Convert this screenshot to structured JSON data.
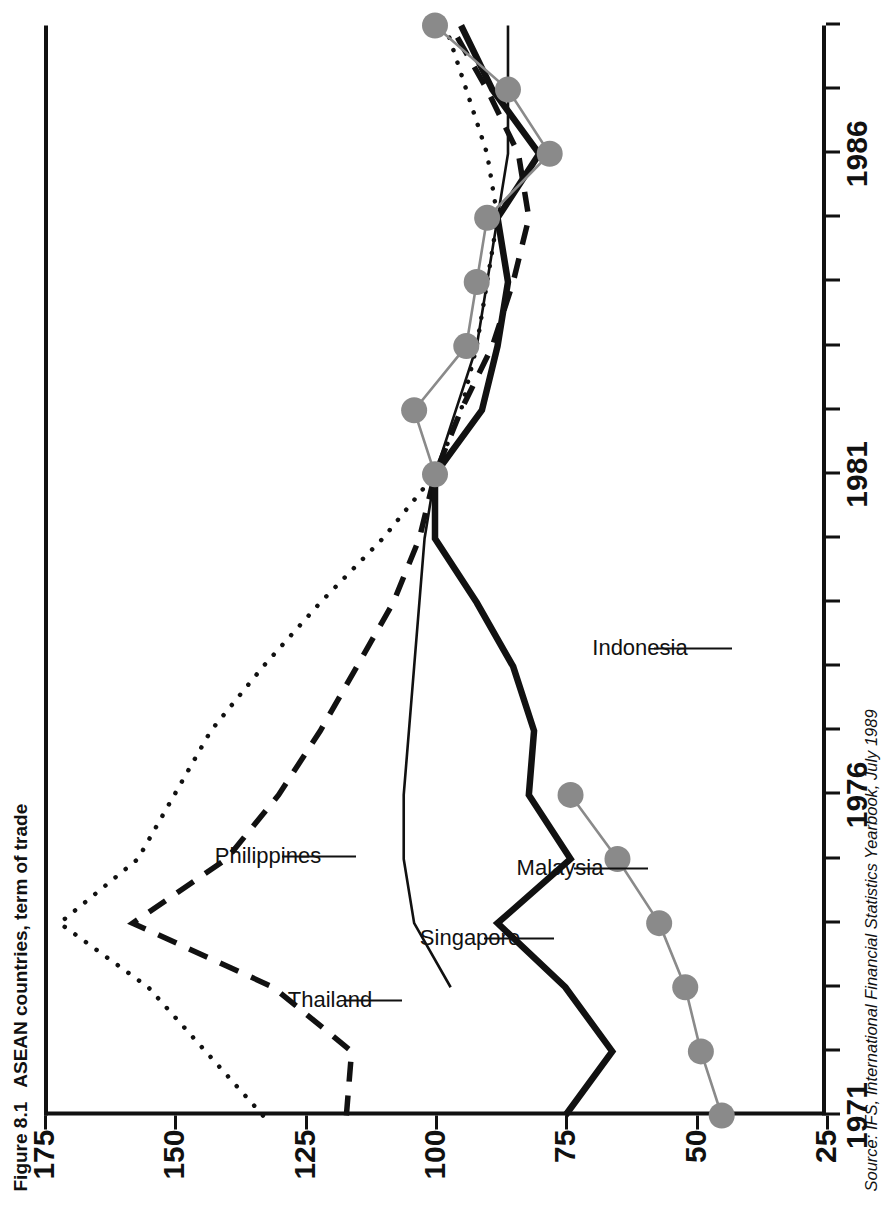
{
  "figure": {
    "number": "Figure 8.1",
    "caption": "ASEAN countries, term of trade",
    "source": "Source: IFS, International Financial Statistics Yearbook, July 1989"
  },
  "annotations": {
    "philippines": "Philippines",
    "thailand": "Thailand",
    "singapore": "Singapore",
    "malaysia": "Malaysia",
    "indonesia": "Indonesia"
  },
  "chart_data": {
    "type": "line",
    "title": "ASEAN countries, term of trade",
    "xlabel": "",
    "ylabel": "",
    "xlim": [
      1971,
      1988
    ],
    "ylim": [
      25,
      175
    ],
    "yticks": [
      175,
      150,
      125,
      100,
      75,
      50,
      25
    ],
    "xticks_labeled": [
      1971,
      1976,
      1981,
      1986
    ],
    "xticks_all": [
      1971,
      1972,
      1973,
      1974,
      1975,
      1976,
      1977,
      1978,
      1979,
      1980,
      1981,
      1982,
      1983,
      1984,
      1985,
      1986,
      1987,
      1988
    ],
    "grid": false,
    "legend": "inline-annotations",
    "x": [
      1971,
      1972,
      1973,
      1974,
      1975,
      1976,
      1977,
      1978,
      1979,
      1980,
      1981,
      1982,
      1983,
      1984,
      1985,
      1986,
      1987,
      1988
    ],
    "series": [
      {
        "name": "Philippines",
        "style": "dotted",
        "color": "#111111",
        "values": [
          133,
          144,
          155,
          172,
          157,
          150,
          143,
          133,
          122,
          110,
          100,
          95,
          92,
          90,
          88,
          90,
          94,
          98
        ]
      },
      {
        "name": "Thailand",
        "style": "dashed",
        "color": "#111111",
        "values": [
          117,
          116,
          131,
          158,
          140,
          130,
          122,
          115,
          108,
          103,
          100,
          95,
          89,
          85,
          82,
          84,
          90,
          97
        ]
      },
      {
        "name": "Singapore",
        "style": "thin-solid",
        "color": "#111111",
        "values": [
          null,
          null,
          97,
          104,
          106,
          106,
          105,
          104,
          103,
          102,
          100,
          96,
          92,
          90,
          88,
          86,
          86,
          86
        ]
      },
      {
        "name": "Malaysia",
        "style": "thick-solid",
        "color": "#111111",
        "values": [
          75,
          66,
          75,
          88,
          74,
          82,
          81,
          85,
          92,
          100,
          100,
          91,
          88,
          86,
          88,
          80,
          89,
          95
        ]
      },
      {
        "name": "Indonesia",
        "style": "gray-markers",
        "color": "#8a8a8a",
        "values": [
          45,
          49,
          52,
          57,
          65,
          74,
          null,
          null,
          null,
          null,
          100,
          104,
          94,
          92,
          90,
          78,
          86,
          100
        ]
      }
    ]
  }
}
